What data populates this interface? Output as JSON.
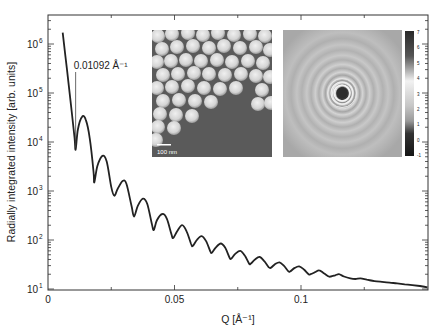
{
  "chart_data": {
    "type": "line",
    "title": "",
    "xlabel": "Q [Å⁻¹]",
    "ylabel": "Radially integrated intensity [arb. units]",
    "xscale": "linear",
    "yscale": "log",
    "xlim": [
      0,
      0.15
    ],
    "ylim": [
      10,
      4000000
    ],
    "grid": false,
    "legend": null,
    "x_ticks": [
      {
        "value": 0,
        "label": "0"
      },
      {
        "value": 0.05,
        "label": "0.05"
      },
      {
        "value": 0.1,
        "label": "0.1"
      }
    ],
    "y_ticks": [
      {
        "value": 10,
        "base": "10",
        "exp": "1"
      },
      {
        "value": 100,
        "base": "10",
        "exp": "2"
      },
      {
        "value": 1000,
        "base": "10",
        "exp": "3"
      },
      {
        "value": 10000,
        "base": "10",
        "exp": "4"
      },
      {
        "value": 100000,
        "base": "10",
        "exp": "5"
      },
      {
        "value": 1000000,
        "base": "10",
        "exp": "6"
      }
    ],
    "annotation": {
      "text": "0.01092 Å⁻¹",
      "x": 0.01092,
      "y": 7000
    },
    "series": [
      {
        "name": "SAXS radial profile",
        "color": "#222222",
        "points": [
          [
            0.0058,
            1700000
          ],
          [
            0.0075,
            300000
          ],
          [
            0.0092,
            50000
          ],
          [
            0.0105,
            12000
          ],
          [
            0.01092,
            7000
          ],
          [
            0.0118,
            18000
          ],
          [
            0.0135,
            33000
          ],
          [
            0.015,
            28000
          ],
          [
            0.0165,
            12000
          ],
          [
            0.018,
            2500
          ],
          [
            0.0183,
            1500
          ],
          [
            0.0195,
            3200
          ],
          [
            0.0215,
            5200
          ],
          [
            0.0232,
            4000
          ],
          [
            0.025,
            1200
          ],
          [
            0.0262,
            800
          ],
          [
            0.0275,
            1100
          ],
          [
            0.0295,
            1600
          ],
          [
            0.031,
            1400
          ],
          [
            0.033,
            500
          ],
          [
            0.034,
            300
          ],
          [
            0.0355,
            500
          ],
          [
            0.0375,
            700
          ],
          [
            0.0392,
            550
          ],
          [
            0.041,
            220
          ],
          [
            0.0418,
            160
          ],
          [
            0.043,
            250
          ],
          [
            0.0452,
            340
          ],
          [
            0.047,
            270
          ],
          [
            0.0488,
            130
          ],
          [
            0.0495,
            110
          ],
          [
            0.051,
            150
          ],
          [
            0.053,
            200
          ],
          [
            0.0548,
            150
          ],
          [
            0.0565,
            85
          ],
          [
            0.0572,
            75
          ],
          [
            0.0588,
            100
          ],
          [
            0.0607,
            120
          ],
          [
            0.0625,
            95
          ],
          [
            0.0642,
            58
          ],
          [
            0.0648,
            55
          ],
          [
            0.0663,
            70
          ],
          [
            0.0683,
            85
          ],
          [
            0.07,
            70
          ],
          [
            0.0718,
            43
          ],
          [
            0.0725,
            42
          ],
          [
            0.074,
            52
          ],
          [
            0.076,
            60
          ],
          [
            0.0778,
            48
          ],
          [
            0.0795,
            33
          ],
          [
            0.0802,
            33
          ],
          [
            0.0818,
            40
          ],
          [
            0.0837,
            45
          ],
          [
            0.0855,
            37
          ],
          [
            0.0872,
            28
          ],
          [
            0.088,
            27
          ],
          [
            0.0897,
            32
          ],
          [
            0.0915,
            35
          ],
          [
            0.0932,
            30
          ],
          [
            0.095,
            23
          ],
          [
            0.0958,
            23
          ],
          [
            0.0975,
            27
          ],
          [
            0.0993,
            29
          ],
          [
            0.1012,
            25
          ],
          [
            0.103,
            20
          ],
          [
            0.1038,
            20
          ],
          [
            0.1055,
            22
          ],
          [
            0.1072,
            24
          ],
          [
            0.109,
            21
          ],
          [
            0.111,
            18
          ],
          [
            0.1118,
            18
          ],
          [
            0.1135,
            19
          ],
          [
            0.115,
            20
          ],
          [
            0.117,
            18
          ],
          [
            0.1195,
            16.5
          ],
          [
            0.1215,
            16
          ],
          [
            0.1235,
            16.5
          ],
          [
            0.126,
            15.5
          ],
          [
            0.129,
            14.5
          ],
          [
            0.132,
            14
          ],
          [
            0.135,
            13.5
          ],
          [
            0.138,
            13
          ],
          [
            0.141,
            12.5
          ],
          [
            0.144,
            12
          ],
          [
            0.147,
            11.5
          ],
          [
            0.15,
            10.8
          ]
        ]
      }
    ],
    "insets": [
      {
        "name": "tem-micrograph",
        "scale_bar_label": "100 nm"
      },
      {
        "name": "saxs-2d-pattern",
        "colorbar_ticks": [
          "7",
          "6",
          "5",
          "4",
          "3",
          "2",
          "1",
          "0",
          "-1"
        ]
      }
    ]
  }
}
